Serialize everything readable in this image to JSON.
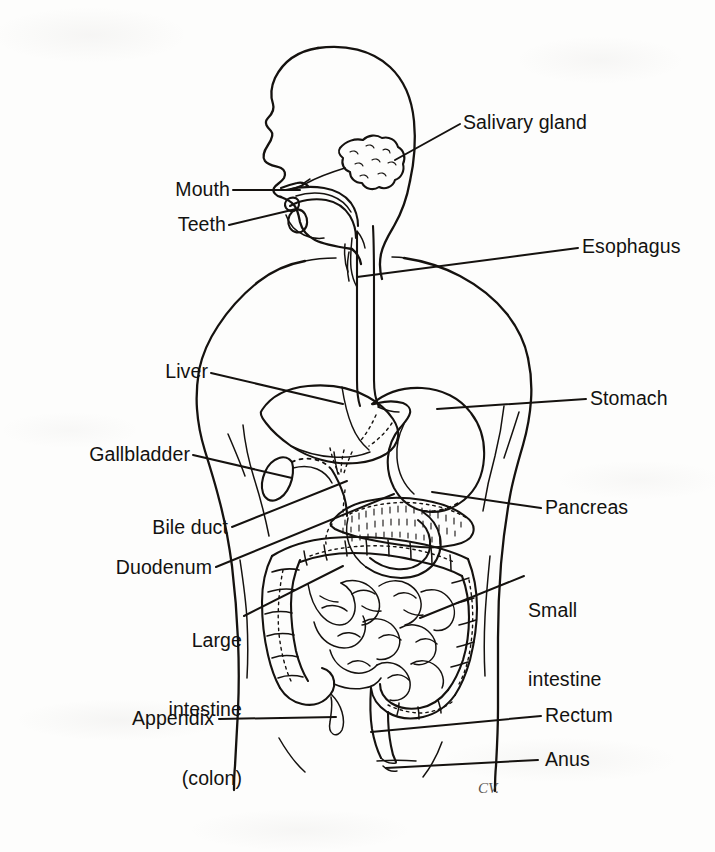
{
  "figure": {
    "type": "anatomical-line-diagram",
    "view": "lateral / anterior composite of head, neck and torso",
    "background_color": "#fdfdfc",
    "ink_color": "#15120f",
    "artist_signature": "CV."
  },
  "labels": {
    "salivary_gland": "Salivary gland",
    "mouth": "Mouth",
    "teeth": "Teeth",
    "esophagus": "Esophagus",
    "liver": "Liver",
    "stomach": "Stomach",
    "gallbladder": "Gallbladder",
    "pancreas": "Pancreas",
    "bile_duct": "Bile duct",
    "duodenum": "Duodenum",
    "small_intestine_line1": "Small",
    "small_intestine_line2": "intestine",
    "large_intestine_line1": "Large",
    "large_intestine_line2": "intestine",
    "large_intestine_line3": "(colon)",
    "appendix": "Appendix",
    "rectum": "Rectum",
    "anus": "Anus"
  },
  "organs": [
    {
      "name": "salivary-gland",
      "side": "right",
      "label": "Salivary gland"
    },
    {
      "name": "mouth",
      "side": "left",
      "label": "Mouth"
    },
    {
      "name": "teeth",
      "side": "left",
      "label": "Teeth"
    },
    {
      "name": "esophagus",
      "side": "right",
      "label": "Esophagus"
    },
    {
      "name": "liver",
      "side": "left",
      "label": "Liver"
    },
    {
      "name": "stomach",
      "side": "right",
      "label": "Stomach"
    },
    {
      "name": "gallbladder",
      "side": "left",
      "label": "Gallbladder"
    },
    {
      "name": "pancreas",
      "side": "right",
      "label": "Pancreas"
    },
    {
      "name": "bile-duct",
      "side": "left",
      "label": "Bile duct"
    },
    {
      "name": "duodenum",
      "side": "left",
      "label": "Duodenum"
    },
    {
      "name": "small-intestine",
      "side": "right",
      "label": "Small intestine"
    },
    {
      "name": "large-intestine",
      "side": "left",
      "label": "Large intestine (colon)"
    },
    {
      "name": "appendix",
      "side": "left",
      "label": "Appendix"
    },
    {
      "name": "rectum",
      "side": "right",
      "label": "Rectum"
    },
    {
      "name": "anus",
      "side": "right",
      "label": "Anus"
    }
  ]
}
